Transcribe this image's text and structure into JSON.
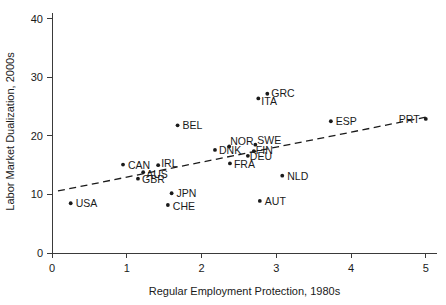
{
  "chart_data": {
    "type": "scatter",
    "title": "",
    "xlabel": "Regular Employment Protection, 1980s",
    "ylabel": "Labor Market Dualization, 2000s",
    "xlim": [
      0,
      5.15
    ],
    "ylim": [
      0,
      41.5
    ],
    "xticks": [
      0,
      1,
      2,
      3,
      4,
      5
    ],
    "xtick_labels": [
      "0",
      "1",
      "2",
      "3",
      "4",
      "5"
    ],
    "yticks": [
      0,
      10,
      20,
      30,
      40
    ],
    "ytick_labels": [
      "0",
      "10",
      "20",
      "30",
      "40"
    ],
    "grid": false,
    "legend": "none",
    "marker_color": "#1a1a1a",
    "trendline": {
      "style": "dashed",
      "color": "#1a1a1a",
      "x": [
        0.08,
        5.0
      ],
      "y": [
        10.6,
        23.2
      ]
    },
    "points": [
      {
        "label": "USA",
        "x": 0.25,
        "y": 8.5,
        "label_dx": 5,
        "label_dy": 4
      },
      {
        "label": "CAN",
        "x": 0.95,
        "y": 15.1,
        "label_dx": 5,
        "label_dy": 4
      },
      {
        "label": "GBR",
        "x": 1.15,
        "y": 12.7,
        "label_dx": 4,
        "label_dy": 4
      },
      {
        "label": "AUS",
        "x": 1.22,
        "y": 13.8,
        "label_dx": 3,
        "label_dy": 6
      },
      {
        "label": "IRL",
        "x": 1.42,
        "y": 15.0,
        "label_dx": 3,
        "label_dy": 2
      },
      {
        "label": "CHE",
        "x": 1.55,
        "y": 8.2,
        "label_dx": 5,
        "label_dy": 5
      },
      {
        "label": "JPN",
        "x": 1.6,
        "y": 10.2,
        "label_dx": 5,
        "label_dy": 4
      },
      {
        "label": "BEL",
        "x": 1.68,
        "y": 21.8,
        "label_dx": 5,
        "label_dy": 4
      },
      {
        "label": "DNK",
        "x": 2.18,
        "y": 17.6,
        "label_dx": 4,
        "label_dy": 4
      },
      {
        "label": "NOR",
        "x": 2.37,
        "y": 18.2,
        "label_dx": 1,
        "label_dy": -1
      },
      {
        "label": "FRA",
        "x": 2.38,
        "y": 15.3,
        "label_dx": 4,
        "label_dy": 5
      },
      {
        "label": "DEU",
        "x": 2.62,
        "y": 16.6,
        "label_dx": 2,
        "label_dy": 4
      },
      {
        "label": "FIN",
        "x": 2.7,
        "y": 17.4,
        "label_dx": 2,
        "label_dy": 3
      },
      {
        "label": "SWE",
        "x": 2.72,
        "y": 18.5,
        "label_dx": 2,
        "label_dy": -1
      },
      {
        "label": "ITA",
        "x": 2.76,
        "y": 26.4,
        "label_dx": 3,
        "label_dy": 7
      },
      {
        "label": "AUT",
        "x": 2.78,
        "y": 8.9,
        "label_dx": 5,
        "label_dy": 4
      },
      {
        "label": "GRC",
        "x": 2.88,
        "y": 27.2,
        "label_dx": 4,
        "label_dy": 3
      },
      {
        "label": "NLD",
        "x": 3.08,
        "y": 13.2,
        "label_dx": 5,
        "label_dy": 4
      },
      {
        "label": "ESP",
        "x": 3.73,
        "y": 22.5,
        "label_dx": 5,
        "label_dy": 4
      },
      {
        "label": "PRT",
        "x": 5.0,
        "y": 22.9,
        "label_dx": -27,
        "label_dy": 4
      }
    ]
  }
}
